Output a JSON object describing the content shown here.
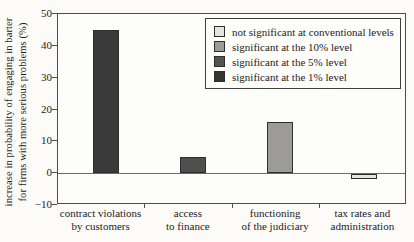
{
  "figure": {
    "background": "#fcfbf7",
    "ylabel_line1": "increase in probability of engaging in barter",
    "ylabel_line2": "for firms with more serious problems (%)"
  },
  "legend": {
    "position": "top-right",
    "items": [
      {
        "label": "not significant at conventional levels",
        "color": "#e4e3df"
      },
      {
        "label": "significant at the 10% level",
        "color": "#9c9b97"
      },
      {
        "label": "significant at the 5% level",
        "color": "#535353"
      },
      {
        "label": "significant at the 1% level",
        "color": "#353535"
      }
    ]
  },
  "chart_data": {
    "type": "bar",
    "title": "",
    "xlabel": "",
    "ylabel": "increase in probability of engaging in barter for firms with more serious problems (%)",
    "ylim": [
      -10,
      50
    ],
    "yticks": [
      50,
      40,
      30,
      20,
      10,
      0,
      -10
    ],
    "categories": [
      [
        "contract violations",
        "by customers"
      ],
      [
        "access",
        "to finance"
      ],
      [
        "functioning",
        "of the judiciary"
      ],
      [
        "tax rates and",
        "administration"
      ]
    ],
    "values": [
      45,
      5,
      16,
      -1.5
    ],
    "significance": [
      "significant at the 1% level",
      "significant at the 5% level",
      "significant at the 10% level",
      "not significant at conventional levels"
    ],
    "bar_colors": [
      "#3a3a3a",
      "#4f4f4f",
      "#9c9b97",
      "#e4e3df"
    ],
    "grid": false,
    "zero_line": true,
    "legend_position": "top-right"
  }
}
